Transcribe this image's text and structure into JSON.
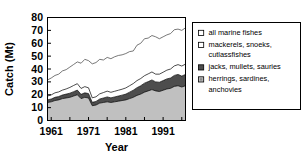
{
  "chart_data": {
    "type": "area",
    "title": "",
    "xlabel": "Year",
    "ylabel": "Catch (Mt)",
    "xlim": [
      1960,
      1997
    ],
    "ylim": [
      0,
      80
    ],
    "grid": false,
    "stacked": true,
    "legend_position": "right",
    "y_ticks": [
      0,
      10,
      20,
      30,
      40,
      50,
      60,
      70,
      80
    ],
    "y_tick_labels": [
      "0",
      "10",
      "20",
      "30",
      "40",
      "50",
      "60",
      "70",
      "80"
    ],
    "x_ticks": [
      1961,
      1966,
      1971,
      1976,
      1981,
      1986,
      1991,
      1996
    ],
    "x_tick_labels": [
      "1961",
      "",
      "1971",
      "",
      "1981",
      "",
      "1991",
      ""
    ],
    "x_major_labeled": [
      "1961",
      "1971",
      "1981",
      "1991"
    ],
    "x": [
      1960,
      1961,
      1962,
      1963,
      1964,
      1965,
      1966,
      1967,
      1968,
      1969,
      1970,
      1971,
      1972,
      1973,
      1974,
      1975,
      1976,
      1977,
      1978,
      1979,
      1980,
      1981,
      1982,
      1983,
      1984,
      1985,
      1986,
      1987,
      1988,
      1989,
      1990,
      1991,
      1992,
      1993,
      1994,
      1995,
      1996,
      1997
    ],
    "series": [
      {
        "name": "all marine fishes",
        "marker": "open-square-white",
        "color": "#ffffff",
        "edge_color": "#000000",
        "is_total_line": true,
        "values": [
          31.5,
          33.0,
          35.0,
          36.0,
          38.5,
          39.5,
          41.5,
          43.5,
          45.5,
          44.5,
          47.5,
          46.5,
          44.0,
          45.0,
          47.5,
          47.0,
          49.0,
          48.0,
          49.5,
          50.5,
          51.0,
          52.0,
          53.5,
          54.0,
          58.5,
          60.0,
          63.5,
          64.0,
          66.0,
          65.0,
          63.5,
          65.0,
          66.5,
          67.5,
          70.5,
          71.0,
          70.0,
          72.0
        ]
      },
      {
        "name": "mackerels, snoeks, cutlassfishes",
        "marker": "open-square-white",
        "color": "#ffffff",
        "edge_color": "#000000",
        "values": [
          3.0,
          3.2,
          3.5,
          3.6,
          3.8,
          4.0,
          4.5,
          4.8,
          5.0,
          4.6,
          4.8,
          4.5,
          3.5,
          3.6,
          4.0,
          4.2,
          4.5,
          4.3,
          4.4,
          4.5,
          4.6,
          4.8,
          5.0,
          5.2,
          5.5,
          5.6,
          5.8,
          6.0,
          6.2,
          6.0,
          6.3,
          6.5,
          6.8,
          7.0,
          7.4,
          7.6,
          7.8,
          8.0
        ]
      },
      {
        "name": "jacks, mullets, sauries",
        "marker": "filled-square-dark",
        "color": "#4d4d4d",
        "edge_color": "#000000",
        "values": [
          2.0,
          2.2,
          2.5,
          2.6,
          2.8,
          3.0,
          3.2,
          3.4,
          3.6,
          3.3,
          3.5,
          3.4,
          2.6,
          2.8,
          3.2,
          3.5,
          3.8,
          3.6,
          3.8,
          4.0,
          4.2,
          4.5,
          5.0,
          5.5,
          6.0,
          6.5,
          7.0,
          7.2,
          7.5,
          7.0,
          7.2,
          7.5,
          7.8,
          8.0,
          8.5,
          8.8,
          8.5,
          8.8
        ]
      },
      {
        "name": "herrings, sardines, anchovies",
        "marker": "filled-square-light",
        "color": "#c0c0c0",
        "edge_color": "#000000",
        "values": [
          14.0,
          14.5,
          15.5,
          16.0,
          17.0,
          17.5,
          18.0,
          19.0,
          20.0,
          17.0,
          18.0,
          17.5,
          11.5,
          12.0,
          13.5,
          14.0,
          14.5,
          14.0,
          14.5,
          15.0,
          15.5,
          16.0,
          17.0,
          18.0,
          19.5,
          20.5,
          22.0,
          23.0,
          24.0,
          23.0,
          22.5,
          23.5,
          24.5,
          25.0,
          26.5,
          27.0,
          26.0,
          27.0
        ]
      }
    ]
  },
  "legend": {
    "items": [
      {
        "label_line1": "all marine fishes",
        "label_line2": ""
      },
      {
        "label_line1": "mackerels, snoeks,",
        "label_line2": "cutlassfishes"
      },
      {
        "label_line1": "jacks, mullets, sauries",
        "label_line2": ""
      },
      {
        "label_line1": "herrings, sardines,",
        "label_line2": "anchovies"
      }
    ]
  }
}
